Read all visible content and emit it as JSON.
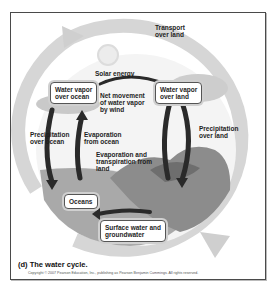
{
  "diagram": {
    "caption": "(d) The water cycle.",
    "copyright": "Copyright © 2007 Pearson Education, Inc., publishing as Pearson Benjamin Cummings. All rights reserved.",
    "nodes": {
      "vapor_ocean": "Water vapor\nover ocean",
      "vapor_land": "Water vapor\nover land",
      "oceans": "Oceans",
      "surface_water": "Surface water and\ngroundwater"
    },
    "labels": {
      "solar": "Solar energy",
      "transport": "Transport\nover land",
      "net_movement": "Net movement\nof water vapor\nby wind",
      "evap_ocean": "Evaporation\nfrom ocean",
      "evap_land": "Evaporation and\ntranspiration from\nland",
      "precip_ocean": "Precipitation\nover ocean",
      "precip_land": "Precipitation\nover land"
    },
    "colors": {
      "ring": "#d4d4d4",
      "arrow": "#2a2a2a",
      "land": "#8a8a8a",
      "water": "#a8a8a8",
      "border": "#4a4a4a"
    }
  }
}
